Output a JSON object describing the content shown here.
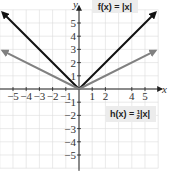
{
  "chart_data": {
    "type": "line",
    "title": "",
    "xlabel": "x",
    "ylabel": "y",
    "xlim": [
      -6,
      6
    ],
    "ylim": [
      -6,
      6
    ],
    "grid": true,
    "x_ticks": [
      -5,
      -4,
      -3,
      -2,
      -1,
      1,
      2,
      4,
      5
    ],
    "y_ticks": [
      5,
      4,
      3,
      2,
      1,
      -1,
      -2,
      -3,
      -4,
      -5
    ],
    "series": [
      {
        "name": "f(x) = |x|",
        "color": "#111111",
        "x": [
          -5.8,
          0,
          5.8
        ],
        "y": [
          5.8,
          0,
          5.8
        ]
      },
      {
        "name": "h(x) = ½|x|",
        "color": "#808080",
        "x": [
          -5.8,
          0,
          5.8
        ],
        "y": [
          2.9,
          0,
          2.9
        ]
      }
    ],
    "annotations": [
      {
        "text": "f(x) = |x|",
        "position": "top"
      },
      {
        "text": "h(x) = ½|x|",
        "position": "right-below-axis"
      }
    ]
  },
  "labels": {
    "x_axis": "x",
    "y_axis": "y",
    "f_label": "f(x) = |x|",
    "h_label_prefix": "h(x) = ",
    "h_label_frac_num": "1",
    "h_label_frac_den": "2",
    "h_label_suffix": "|x|"
  }
}
